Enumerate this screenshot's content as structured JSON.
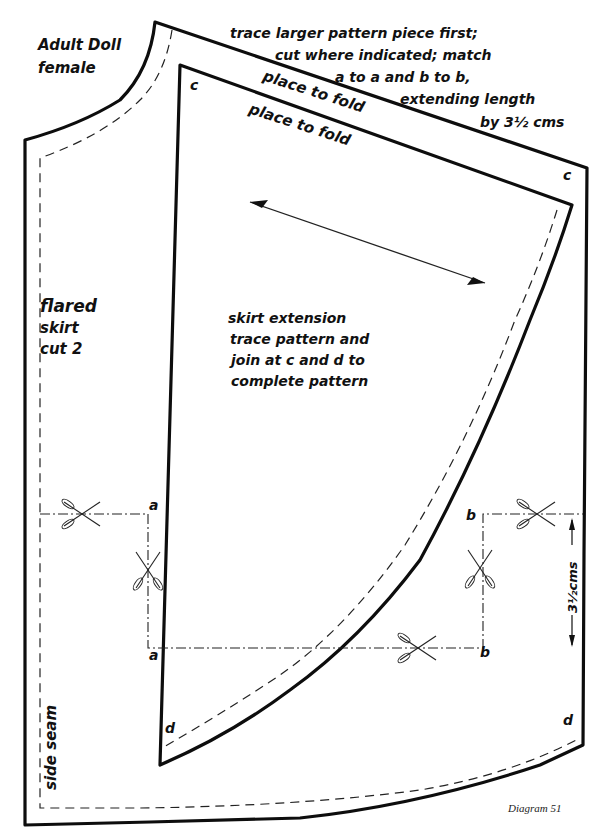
{
  "diagram": {
    "title_lines": [
      "Adult Doll",
      "female"
    ],
    "instructions": [
      "trace larger pattern piece first;",
      "cut where indicated; match",
      "a to a and b to b,",
      "extending length",
      "by 3½ cms"
    ],
    "fold_labels": {
      "outer": "place to fold",
      "inner": "place to fold"
    },
    "piece_label": [
      "flared",
      "skirt",
      "cut 2"
    ],
    "extension_label": [
      "skirt extension",
      "trace pattern and",
      "join at c and d to",
      "complete pattern"
    ],
    "side_seam_label": "side seam",
    "measurement_label": "3½cms",
    "point_labels": {
      "c_top_left": "c",
      "c_top_right": "c",
      "a_upper": "a",
      "a_lower": "a",
      "b_upper": "b",
      "b_lower": "b",
      "d_left": "d",
      "d_right": "d"
    },
    "caption": "Diagram 51"
  }
}
